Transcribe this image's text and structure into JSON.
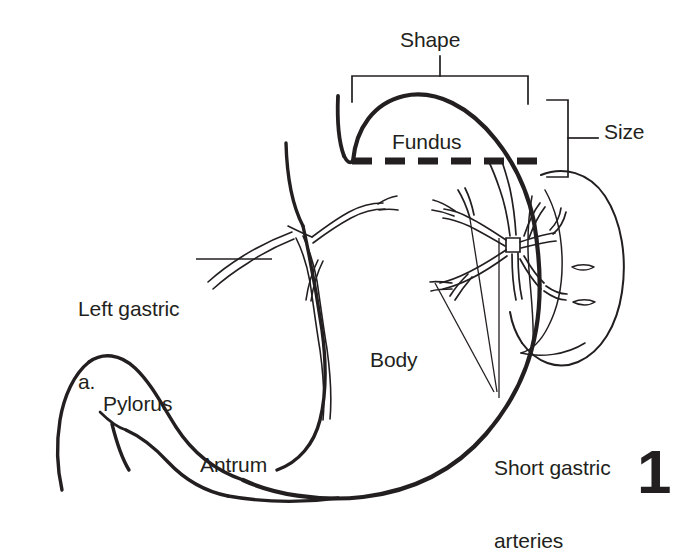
{
  "figure": {
    "number": "1",
    "background_color": "#ffffff",
    "ink_color": "#231f20"
  },
  "labels": {
    "shape": "Shape",
    "size": "Size",
    "fundus": "Fundus",
    "body": "Body",
    "pylorus": "Pylorus",
    "antrum": "Antrum",
    "left_gastric_line1": "Left gastric",
    "left_gastric_line2": "a.",
    "short_gastric_line1": "Short gastric",
    "short_gastric_line2": "arteries"
  },
  "annotations": {
    "shape_bracket": "horizontal-bracket-over-fundus-dome",
    "size_bracket": "vertical-bracket-right-of-fundus",
    "fundus_divider": "thick-dashed-horizontal-line",
    "left_gastric_leader": "horizontal-leader-line",
    "short_gastric_leader": "vertical-leader-line"
  },
  "structures": {
    "esophagus": "esophagus",
    "stomach_outline": "stomach-outline",
    "duodenum": "duodenum",
    "spleen": "spleen",
    "left_gastric_artery": "left-gastric-artery-branches",
    "short_gastric_arteries": "short-gastric-artery-branches"
  }
}
